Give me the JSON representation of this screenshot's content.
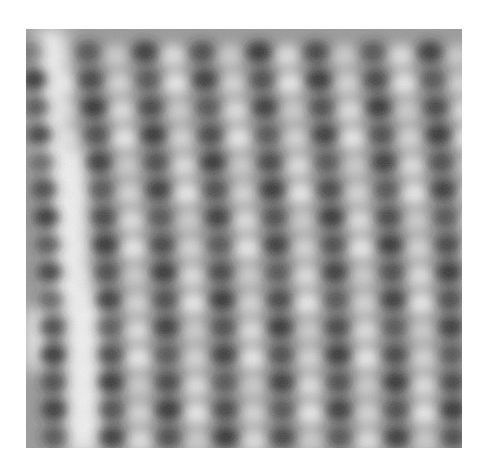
{
  "image": {
    "kind": "grayscale scanning-probe micrograph of an atomic lattice",
    "frame": {
      "left": 26,
      "top": 29,
      "width": 436,
      "height": 419
    },
    "colors": {
      "page_bg": "#ffffff",
      "base_gray": "#9a9a9a",
      "dark_spot": "#262626",
      "bright_spot": "#ececec",
      "bright_band": "#f4f4f4"
    },
    "lattice": {
      "columns": 7,
      "rows": 15,
      "col_spacing": 57,
      "row_spacing": 27.5,
      "origin_x": 62,
      "origin_y": 23,
      "row_shift_per_row": 1.6,
      "bright_offset_x": 28,
      "spot_rx": 13,
      "spot_ry": 11,
      "bright_rx": 15,
      "bright_ry": 11
    },
    "bright_bands": [
      {
        "x": 10,
        "y": 0,
        "w": 30,
        "h": 140
      },
      {
        "x": 22,
        "y": 120,
        "w": 38,
        "h": 160
      },
      {
        "x": 40,
        "y": 260,
        "w": 36,
        "h": 160
      },
      {
        "x": 0,
        "y": 280,
        "w": 22,
        "h": 60
      }
    ]
  }
}
